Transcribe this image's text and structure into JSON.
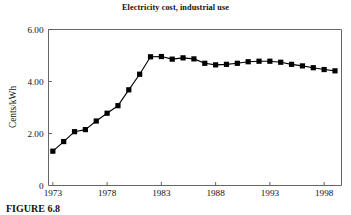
{
  "figure": {
    "caption": "FIGURE 6.8"
  },
  "chart_data": {
    "type": "line",
    "title": "Electricity cost, industrial use",
    "xlabel": "",
    "ylabel": "Cents/kWh",
    "xlim": [
      1972.6,
      1999.6
    ],
    "ylim": [
      0,
      6
    ],
    "grid": false,
    "legend": null,
    "marker": "square",
    "marker_color": "#000000",
    "line_color": "#000000",
    "x_ticks": [
      1973,
      1978,
      1983,
      1988,
      1993,
      1998
    ],
    "x_tick_labels": [
      "1973",
      "1978",
      "1983",
      "1988",
      "1993",
      "1998"
    ],
    "y_ticks": [
      0,
      2,
      4,
      6
    ],
    "y_tick_labels": [
      "0",
      "2.00",
      "4.00",
      "6.00"
    ],
    "x": [
      1973,
      1974,
      1975,
      1976,
      1977,
      1978,
      1979,
      1980,
      1981,
      1982,
      1983,
      1984,
      1985,
      1986,
      1987,
      1988,
      1989,
      1990,
      1991,
      1992,
      1993,
      1994,
      1995,
      1996,
      1997,
      1998,
      1999
    ],
    "values": [
      1.32,
      1.69,
      2.07,
      2.15,
      2.48,
      2.78,
      3.07,
      3.68,
      4.28,
      4.95,
      4.96,
      4.86,
      4.91,
      4.87,
      4.7,
      4.64,
      4.66,
      4.7,
      4.76,
      4.78,
      4.78,
      4.74,
      4.66,
      4.6,
      4.53,
      4.46,
      4.41
    ],
    "series": [
      {
        "name": "Electricity cost, industrial use",
        "values": [
          1.32,
          1.69,
          2.07,
          2.15,
          2.48,
          2.78,
          3.07,
          3.68,
          4.28,
          4.95,
          4.96,
          4.86,
          4.91,
          4.87,
          4.7,
          4.64,
          4.66,
          4.7,
          4.76,
          4.78,
          4.78,
          4.74,
          4.66,
          4.6,
          4.53,
          4.46,
          4.41
        ]
      }
    ]
  }
}
